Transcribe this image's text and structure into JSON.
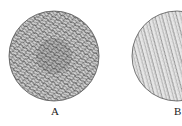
{
  "figure": {
    "panels": [
      {
        "label": "A",
        "description": "circular field with dense, dark swirling texture"
      },
      {
        "label": "B",
        "description": "circular field with lighter, finer streaked texture (partially cropped at right edge)"
      }
    ],
    "colors": {
      "background": "#ffffff",
      "outline": "#555555",
      "texture_dark": "#3a3a3a",
      "texture_light": "#8a8a8a"
    }
  }
}
